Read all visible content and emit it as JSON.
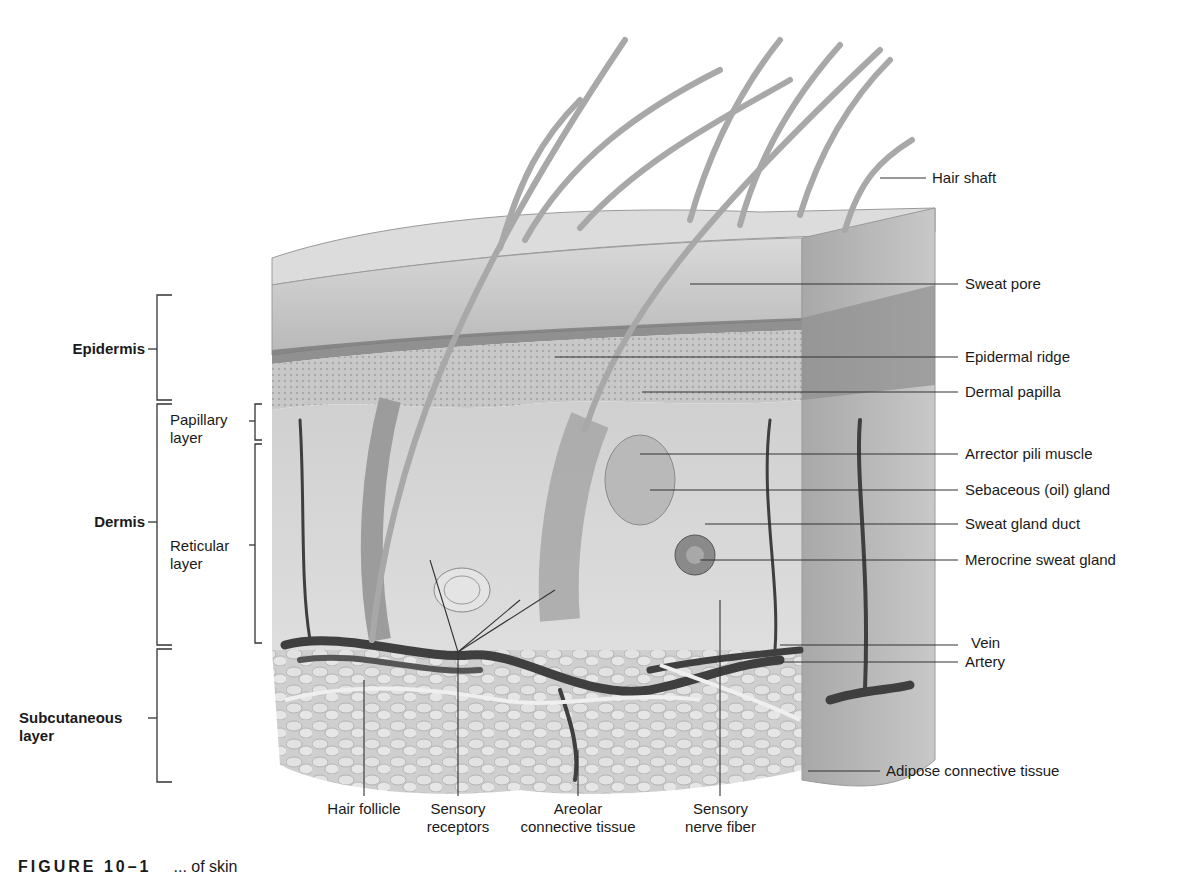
{
  "figure": {
    "type": "anatomical-illustration",
    "caption_number": "FIGURE 10–1",
    "caption_text": "... of skin",
    "caption_note": "caption partially cut off at bottom edge"
  },
  "left_labels": {
    "epidermis": "Epidermis",
    "dermis": "Dermis",
    "papillary_layer": [
      "Papillary",
      "layer"
    ],
    "reticular_layer": [
      "Reticular",
      "layer"
    ],
    "subcutaneous_layer": [
      "Subcutaneous",
      "layer"
    ]
  },
  "right_labels": [
    {
      "id": "hair-shaft",
      "text": "Hair shaft"
    },
    {
      "id": "sweat-pore",
      "text": "Sweat pore"
    },
    {
      "id": "epidermal-ridge",
      "text": "Epidermal ridge"
    },
    {
      "id": "dermal-papilla",
      "text": "Dermal papilla"
    },
    {
      "id": "arrector-pili-muscle",
      "text": "Arrector pili muscle"
    },
    {
      "id": "sebaceous-gland",
      "text": "Sebaceous (oil) gland"
    },
    {
      "id": "sweat-gland-duct",
      "text": "Sweat gland duct"
    },
    {
      "id": "merocrine-sweat-gland",
      "text": "Merocrine sweat gland"
    },
    {
      "id": "vein",
      "text": "Vein"
    },
    {
      "id": "artery",
      "text": "Artery"
    },
    {
      "id": "adipose-connective-tissue",
      "text": "Adipose connective tissue"
    }
  ],
  "bottom_labels": [
    {
      "id": "hair-follicle",
      "lines": [
        "Hair follicle",
        ""
      ]
    },
    {
      "id": "sensory-receptors",
      "lines": [
        "Sensory",
        "receptors"
      ]
    },
    {
      "id": "areolar-connective-tissue",
      "lines": [
        "Areolar",
        "connective tissue"
      ]
    },
    {
      "id": "sensory-nerve-fiber",
      "lines": [
        "Sensory",
        "nerve fiber"
      ]
    }
  ],
  "colors": {
    "background": "#ffffff",
    "epidermis_top": "#c9c9c9",
    "stratum_band": "#8a8a8a",
    "dermis": "#d6d6d6",
    "subcutaneous": "#cfcfcf",
    "vessels": "#4a4a4a",
    "leader_lines": "#333333"
  }
}
